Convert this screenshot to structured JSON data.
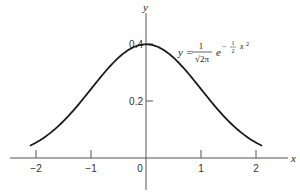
{
  "chart_data": {
    "type": "line",
    "title": "",
    "xlabel": "x",
    "ylabel": "y",
    "xlim": [
      -2.5,
      2.6
    ],
    "ylim": [
      -0.11,
      0.51
    ],
    "grid": false,
    "x_ticks": [
      -2,
      -1,
      0,
      1,
      2
    ],
    "x_tick_labels": [
      "−2",
      "−1",
      "0",
      "1",
      "2"
    ],
    "y_ticks": [
      0.2,
      0.4
    ],
    "y_tick_labels": [
      "0.2",
      "0.4"
    ],
    "series": [
      {
        "name": "standard normal density",
        "function": "y = (1/sqrt(2*pi)) * exp(-x^2/2)",
        "x_range": [
          -2.1,
          2.1
        ],
        "x": [
          -2.1,
          -2.0,
          -1.5,
          -1.0,
          -0.5,
          0,
          0.5,
          1.0,
          1.5,
          2.0,
          2.1
        ],
        "values": [
          0.044,
          0.054,
          0.13,
          0.242,
          0.352,
          0.399,
          0.352,
          0.242,
          0.13,
          0.054,
          0.044
        ]
      }
    ],
    "annotations": [
      {
        "text": "y = 1/√(2π) e^(−½ x²)",
        "parts": {
          "lhs": "y =",
          "num": "1",
          "den": "√2π",
          "base": "e",
          "exp_sign": "−",
          "exp_num": "1",
          "exp_den": "2",
          "exp_var": "x",
          "exp_pow": "2"
        },
        "position": "upper right of peak"
      }
    ]
  },
  "colors": {
    "curve": "#1a1a1a",
    "axis": "#555555",
    "text": "#333333",
    "background": "#ffffff"
  }
}
